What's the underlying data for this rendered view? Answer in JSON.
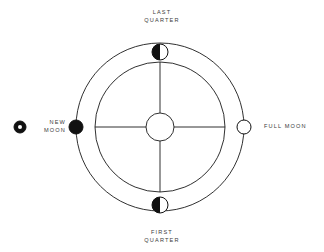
{
  "diagram": {
    "background_color": "#ffffff",
    "stroke_color": "#1a1a1a",
    "fill_dark": "#111111",
    "fill_light": "#ffffff",
    "text_color": "#3b3b3b",
    "geometry": {
      "center_x": 160,
      "center_y": 127,
      "outer_circle_radius": 84,
      "inner_circle_radius": 65,
      "core_circle_radius": 14
    },
    "labels": {
      "top": "LAST\nQUARTER",
      "bottom": "FIRST\nQUARTER",
      "left": "NEW\nMOON",
      "right": "FULL MOON"
    },
    "markers": [
      {
        "id": "last-quarter",
        "label": "LAST QUARTER",
        "position": "top",
        "phase": "half-left-dark",
        "x": 160,
        "y": 52,
        "radius": 8
      },
      {
        "id": "new-moon",
        "label": "NEW MOON",
        "position": "left",
        "phase": "full-dark",
        "x": 76,
        "y": 127,
        "radius": 7
      },
      {
        "id": "full-moon",
        "label": "FULL MOON",
        "position": "right",
        "phase": "full-light",
        "x": 244,
        "y": 127,
        "radius": 7
      },
      {
        "id": "first-quarter",
        "label": "FIRST QUARTER",
        "position": "bottom",
        "phase": "half-left-dark",
        "x": 160,
        "y": 205,
        "radius": 8
      }
    ],
    "legend_icon": {
      "id": "new-moon-glyph",
      "x": 20,
      "y": 127,
      "outer_radius": 6,
      "inner_radius": 2
    }
  }
}
